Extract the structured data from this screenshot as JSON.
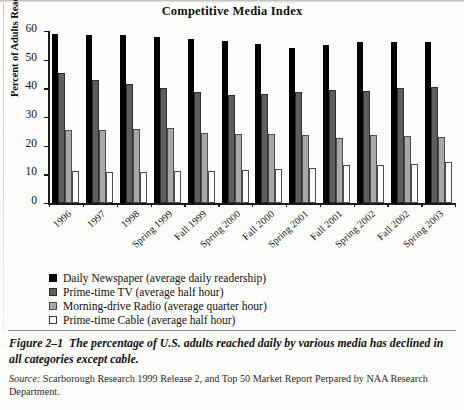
{
  "chart_data": {
    "type": "bar",
    "title": "Competitive Media Index",
    "xlabel": "",
    "ylabel": "Percent of Adults Reached",
    "ylim": [
      0,
      60
    ],
    "yticks": [
      0,
      10,
      20,
      30,
      40,
      50,
      60
    ],
    "grid": false,
    "legend_position": "below-plot",
    "categories": [
      "1996",
      "1997",
      "1998",
      "Spring 1999",
      "Fall 1999",
      "Spring 2000",
      "Fall 2000",
      "Spring 2001",
      "Fall 2001",
      "Spring 2002",
      "Fall 2002",
      "Spring 2003"
    ],
    "series": [
      {
        "name": "Daily Newspaper (average daily readership)",
        "color": "#000000",
        "values": [
          58.8,
          58.6,
          58.5,
          58.0,
          57.2,
          56.6,
          55.4,
          54.0,
          55.0,
          56.2,
          56.2,
          56.0
        ]
      },
      {
        "name": "Prime-time TV (average half hour)",
        "color": "#5e5e5e",
        "values": [
          45.2,
          42.8,
          41.4,
          40.0,
          38.6,
          37.6,
          38.0,
          38.8,
          39.4,
          39.2,
          40.0,
          40.6
        ]
      },
      {
        "name": "Morning-drive Radio (average quarter hour)",
        "color": "#a8a8a8",
        "values": [
          25.6,
          25.6,
          25.8,
          26.0,
          24.4,
          24.0,
          24.0,
          23.6,
          22.8,
          23.6,
          23.4,
          23.2
        ]
      },
      {
        "name": "Prime-time Cable (average half hour)",
        "color": "#ffffff",
        "values": [
          11.2,
          10.8,
          10.8,
          11.0,
          11.2,
          11.4,
          11.8,
          12.2,
          13.2,
          13.4,
          13.6,
          14.4
        ]
      }
    ]
  },
  "figure": {
    "number": "Figure 2–1",
    "caption": "The percentage of U.S. adults reached daily by various media has declined in all categories except cable.",
    "source_label": "Source:",
    "source_text": "Scarborough Research 1999 Release 2, and Top 50 Market Report Perpared by NAA Research Department."
  }
}
